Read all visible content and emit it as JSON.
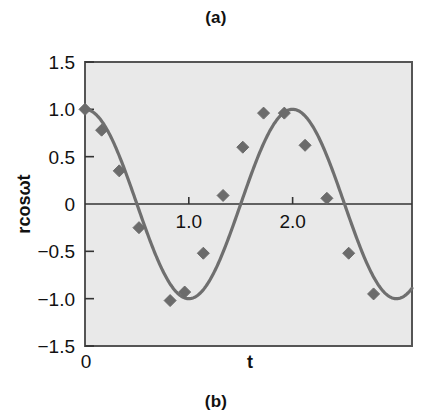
{
  "figure": {
    "caption_top": "(a)",
    "caption_bottom": "(b)"
  },
  "colors": {
    "plot_background": "#e9e9e9",
    "plot_border": "#555555",
    "curve": "#6f6f6f",
    "marker": "#6b6b6b",
    "axis_line": "#333333",
    "text": "#111111"
  },
  "chart_data": {
    "type": "line",
    "title": "",
    "subtitle": "",
    "xlabel": "t",
    "ylabel": "rcosωt",
    "xlim": [
      0,
      3.15
    ],
    "ylim": [
      -1.5,
      1.5
    ],
    "grid": false,
    "legend": null,
    "x_ticks": [
      {
        "value": 0,
        "label": "0"
      },
      {
        "value": 1.0,
        "label": "1.0"
      },
      {
        "value": 2.0,
        "label": "2.0"
      }
    ],
    "y_ticks": [
      {
        "value": 1.5,
        "label": "1.5"
      },
      {
        "value": 1.0,
        "label": "1.0"
      },
      {
        "value": 0.5,
        "label": "0.5"
      },
      {
        "value": 0.0,
        "label": "0"
      },
      {
        "value": -0.5,
        "label": "−0.5"
      },
      {
        "value": -1.0,
        "label": "−1.0"
      },
      {
        "value": -1.5,
        "label": "−1.5"
      }
    ],
    "marker_shape": "diamond",
    "series": [
      {
        "name": "rcosωt",
        "x": [
          0.0,
          0.16,
          0.32,
          0.48,
          0.66,
          0.82,
          0.96,
          1.12,
          1.28,
          1.46,
          1.62,
          1.78,
          1.96,
          2.12,
          2.28,
          2.46,
          2.62,
          2.78,
          2.96
        ],
        "values": [
          1.0,
          0.78,
          0.35,
          -0.25,
          -0.72,
          -1.02,
          -0.93,
          -0.52,
          0.09,
          0.6,
          0.96,
          0.96,
          0.96,
          0.62,
          0.06,
          -0.52,
          -0.95,
          -0.95,
          -0.95
        ]
      }
    ],
    "points": [
      {
        "x": 0.0,
        "y": 1.0
      },
      {
        "x": 0.16,
        "y": 0.78
      },
      {
        "x": 0.33,
        "y": 0.35
      },
      {
        "x": 0.52,
        "y": -0.25
      },
      {
        "x": 0.82,
        "y": -1.02
      },
      {
        "x": 0.96,
        "y": -0.93
      },
      {
        "x": 1.14,
        "y": -0.52
      },
      {
        "x": 1.33,
        "y": 0.09
      },
      {
        "x": 1.52,
        "y": 0.6
      },
      {
        "x": 1.72,
        "y": 0.96
      },
      {
        "x": 1.92,
        "y": 0.96
      },
      {
        "x": 2.12,
        "y": 0.62
      },
      {
        "x": 2.33,
        "y": 0.06
      },
      {
        "x": 2.54,
        "y": -0.52
      },
      {
        "x": 2.78,
        "y": -0.95
      }
    ]
  }
}
